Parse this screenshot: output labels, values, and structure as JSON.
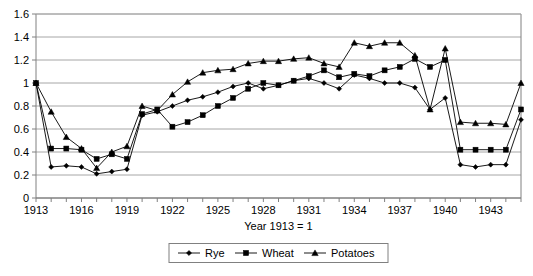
{
  "chart_data": {
    "type": "line",
    "title": "",
    "xlabel": "Year 1913 = 1",
    "ylabel": "",
    "ylim": [
      0,
      1.6
    ],
    "ytick_step": 0.2,
    "yticks": [
      "0",
      "0.2",
      "0.4",
      "0.6",
      "0.8",
      "1",
      "1.2",
      "1.4",
      "1.6"
    ],
    "xlim": [
      1913,
      1945
    ],
    "xtick_labels": [
      "1913",
      "1916",
      "1919",
      "1922",
      "1925",
      "1928",
      "1931",
      "1934",
      "1937",
      "1940",
      "1943"
    ],
    "x": [
      1913,
      1914,
      1915,
      1916,
      1917,
      1918,
      1919,
      1920,
      1921,
      1922,
      1923,
      1924,
      1925,
      1926,
      1927,
      1928,
      1929,
      1930,
      1931,
      1932,
      1933,
      1934,
      1935,
      1936,
      1937,
      1938,
      1939,
      1940,
      1941,
      1942,
      1943,
      1944,
      1945
    ],
    "grid": true,
    "legend_position": "bottom",
    "series": [
      {
        "name": "Rye",
        "marker": "diamond",
        "values": [
          1.0,
          0.27,
          0.28,
          0.27,
          0.21,
          0.23,
          0.25,
          0.72,
          0.75,
          0.8,
          0.85,
          0.88,
          0.92,
          0.97,
          1.0,
          0.95,
          0.98,
          1.02,
          1.04,
          1.0,
          0.95,
          1.07,
          1.04,
          1.0,
          1.0,
          0.96,
          0.77,
          0.87,
          0.29,
          0.27,
          0.29,
          0.29,
          0.68
        ]
      },
      {
        "name": "Wheat",
        "marker": "square",
        "values": [
          1.0,
          0.43,
          0.43,
          0.42,
          0.34,
          0.38,
          0.34,
          0.73,
          0.77,
          0.62,
          0.66,
          0.72,
          0.8,
          0.87,
          0.95,
          1.0,
          0.98,
          1.02,
          1.06,
          1.11,
          1.05,
          1.08,
          1.06,
          1.11,
          1.14,
          1.21,
          1.14,
          1.2,
          0.42,
          0.42,
          0.42,
          0.42,
          0.77
        ]
      },
      {
        "name": "Potatoes",
        "marker": "triangle",
        "values": [
          1.0,
          0.75,
          0.53,
          0.43,
          0.26,
          0.4,
          0.45,
          0.8,
          0.76,
          0.9,
          1.01,
          1.09,
          1.11,
          1.12,
          1.17,
          1.19,
          1.19,
          1.21,
          1.22,
          1.17,
          1.14,
          1.35,
          1.32,
          1.35,
          1.35,
          1.24,
          0.77,
          1.3,
          0.66,
          0.65,
          0.65,
          0.64,
          1.0
        ]
      }
    ],
    "legend": [
      "Rye",
      "Wheat",
      "Potatoes"
    ],
    "colors": {
      "series_line": "#000000",
      "grid": "#a6a6a6",
      "axis": "#808080",
      "background": "#ffffff"
    }
  }
}
